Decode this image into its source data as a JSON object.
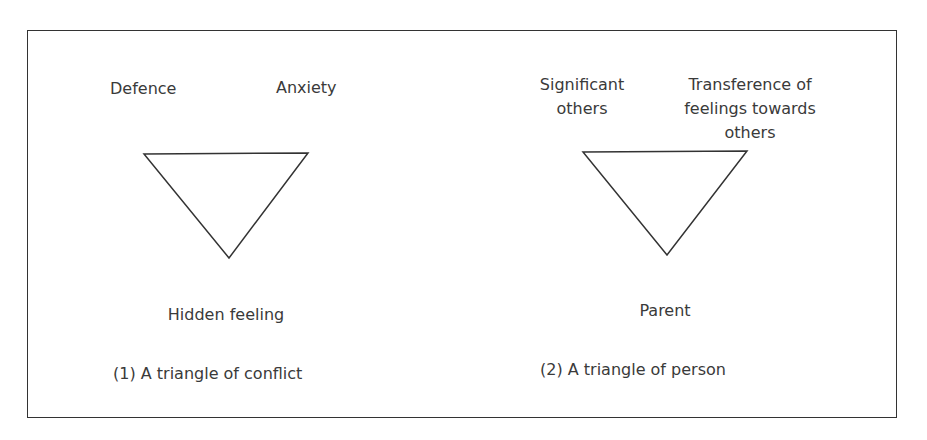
{
  "diagrams": [
    {
      "caption": "(1) A triangle of conflict",
      "vertices": {
        "top_left": "Defence",
        "top_right": "Anxiety",
        "bottom": "Hidden feeling"
      }
    },
    {
      "caption": "(2) A triangle of person",
      "vertices": {
        "top_left_line1": "Significant",
        "top_left_line2": "others",
        "top_right_line1": "Transference of",
        "top_right_line2": "feelings towards",
        "top_right_line3": "others",
        "bottom": "Parent"
      }
    }
  ],
  "colors": {
    "stroke": "#333333",
    "text": "#3a3a3a",
    "background": "#ffffff"
  }
}
